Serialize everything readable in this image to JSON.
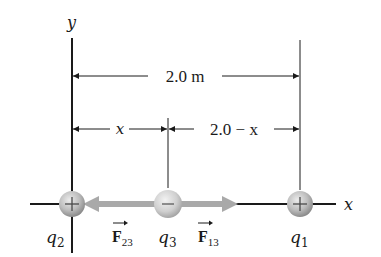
{
  "axes": {
    "x_label": "x",
    "y_label": "y"
  },
  "dimensions": {
    "total": "2.0 m",
    "left_segment": "x",
    "right_segment": "2.0 − x"
  },
  "charges": [
    {
      "id": "q2",
      "label_base": "q",
      "label_sub": "2",
      "sign": "+"
    },
    {
      "id": "q3",
      "label_base": "q",
      "label_sub": "3",
      "sign": "−"
    },
    {
      "id": "q1",
      "label_base": "q",
      "label_sub": "1",
      "sign": "+"
    }
  ],
  "forces": [
    {
      "id": "F23",
      "label_base": "F",
      "label_sub": "23",
      "direction": "left"
    },
    {
      "id": "F13",
      "label_base": "F",
      "label_sub": "13",
      "direction": "right"
    }
  ],
  "colors": {
    "line": "#1a1a1a",
    "force_arrow": "#a9a9a9",
    "sphere_light": "#e6e6e6",
    "sphere_dark": "#8f8f8f"
  }
}
